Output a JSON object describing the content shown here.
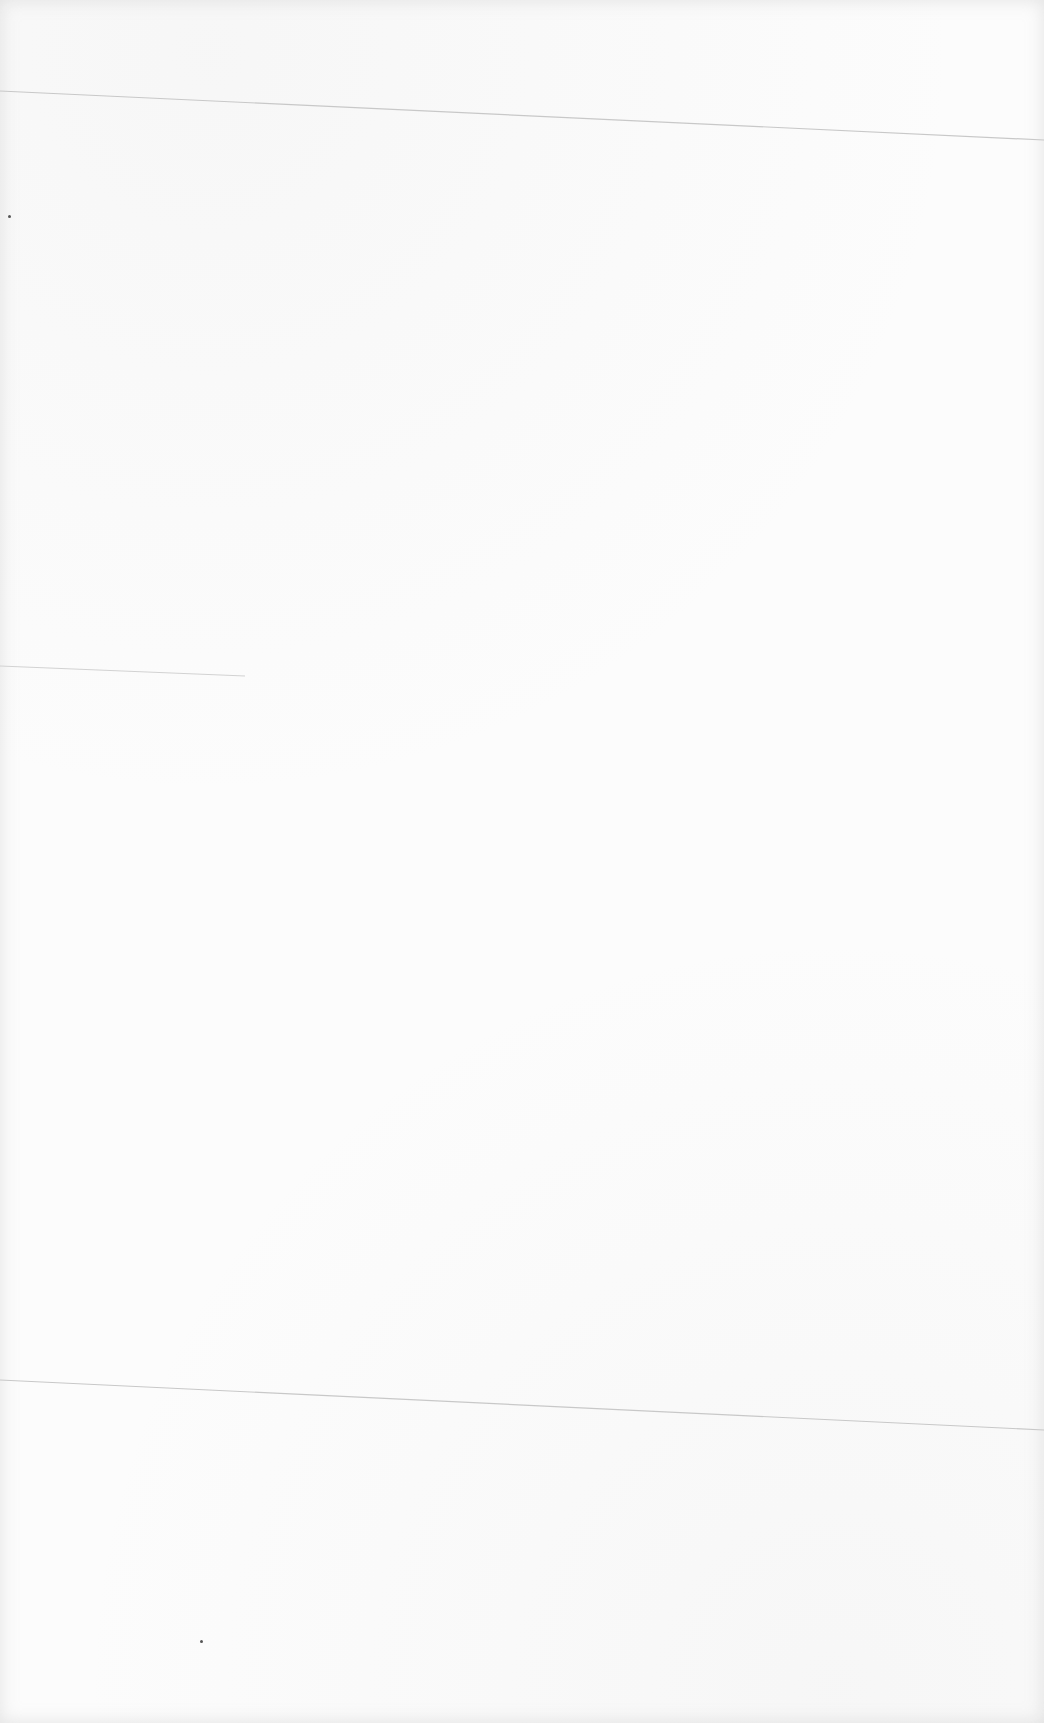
{
  "page": {
    "background": "#fcfcfc",
    "rule_color": "#c8c8c8",
    "rules": [
      {
        "x1": 0,
        "y1": 91,
        "x2": 1044,
        "y2": 140
      },
      {
        "x1": 0,
        "y1": 666,
        "x2": 245,
        "y2": 676
      },
      {
        "x1": 0,
        "y1": 1380,
        "x2": 1044,
        "y2": 1430
      }
    ],
    "specks": [
      {
        "x": 8,
        "y": 215
      },
      {
        "x": 200,
        "y": 1640
      }
    ]
  }
}
